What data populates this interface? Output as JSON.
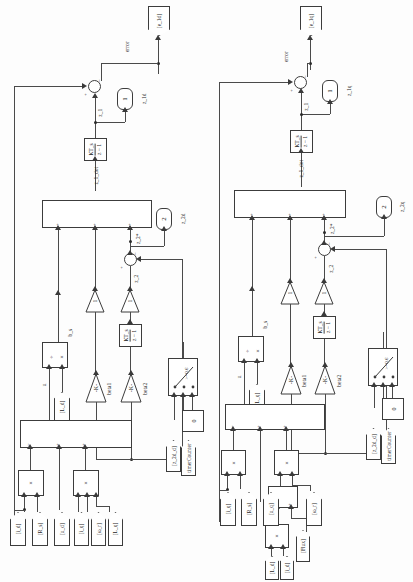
{
  "diagram": {
    "orientation": "rotated-90",
    "halves": [
      "d-axis (left)",
      "q-axis (right)"
    ]
  },
  "left": {
    "outport": "[e_1d]",
    "error_label": "error",
    "signals": {
      "z1": "z_1",
      "z1_dot": "z_1_dot",
      "z2": "z_2",
      "z2_star": "z_2*",
      "u": "u",
      "b": "b_s"
    },
    "constants": {
      "z1d": {
        "value": "1",
        "tag": "z_1d"
      },
      "z2d": {
        "value": "2",
        "tag": "z_2d"
      },
      "zero": "0"
    },
    "integrators": {
      "top": {
        "num": "KT_s",
        "den": "z − 1"
      },
      "bottom": {
        "num": "KT_s",
        "den": "z − 1"
      }
    },
    "gains": {
      "beta1": {
        "value": "-K-",
        "name": "beta1"
      },
      "beta2": {
        "value": "-K-",
        "name": "beta2"
      },
      "unit1": "1",
      "unit2": "1"
    },
    "switch": {
      "criteria": ">=0.6",
      "control_tag": "timerCounter",
      "input_tag": "[z_2d_d]"
    },
    "product_symbol": "×",
    "divide_symbol": "÷",
    "sum_signs_top": [
      "+",
      "−"
    ],
    "sum_signs_mid": [
      "+",
      "−"
    ],
    "bigbox_signs": [
      "+",
      "+",
      "+"
    ],
    "bigbox_signs_lower": [
      "−",
      "+",
      "+"
    ],
    "inports": [
      "[i_d]",
      "[R_s]",
      "[u_d]",
      "[i_q]",
      "[ω_r]",
      "[L_q]"
    ],
    "fromblock_u": "[L_d]"
  },
  "right": {
    "outport": "[e_1q]",
    "error_label": "error",
    "signals": {
      "z1": "z_1",
      "z1_dot": "z_1_dot",
      "z2": "z_2",
      "z2_star": "z_2*",
      "u": "u",
      "b": "b_s"
    },
    "constants": {
      "z1d": {
        "value": "1",
        "tag": "z_1q"
      },
      "z2d": {
        "value": "2",
        "tag": "z_2q"
      },
      "zero": "0"
    },
    "integrators": {
      "top": {
        "num": "KT_s",
        "den": "z − 1"
      },
      "bottom": {
        "num": "KT_s",
        "den": "z − 1"
      }
    },
    "gains": {
      "beta1": {
        "value": "-K-",
        "name": "beta1"
      },
      "beta2": {
        "value": "-K-",
        "name": "beta2"
      },
      "unit1": "1",
      "unit2": "1"
    },
    "switch": {
      "criteria": ">=0.6",
      "control_tag": "timerCounter",
      "input_tag": "[z_2d_d]"
    },
    "product_symbol": "×",
    "divide_symbol": "÷",
    "inports": [
      "[i_q]",
      "[R_s]",
      "[u_q]",
      "[ω_r]",
      "[L_d]",
      "[i_d]",
      "[Flux]"
    ],
    "fromblock_u": "[L_q]"
  }
}
